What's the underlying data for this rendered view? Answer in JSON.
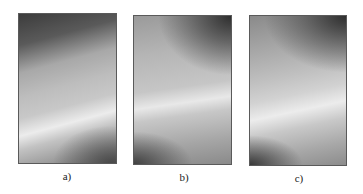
{
  "figure": {
    "panels": [
      {
        "id": "a",
        "label": "a)",
        "description": "grayscale intensity map: dark top, bright diagonal band, darker bottom-right corner"
      },
      {
        "id": "b",
        "label": "b)",
        "description": "grayscale intensity map: dark curved region top-right, bright curved band, dark bottom-left corner"
      },
      {
        "id": "c",
        "label": "c)",
        "description": "grayscale intensity map: dark region top-right, bright diagonal band, dark bottom-left corner"
      }
    ]
  }
}
